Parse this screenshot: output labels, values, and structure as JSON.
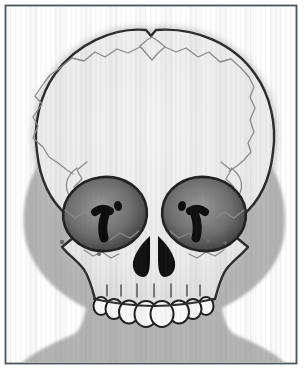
{
  "figure": {
    "view": "frontal"
  },
  "anatomy": {
    "teeth_count": 8,
    "orbit_count": 2,
    "parts": [
      "cranial-vault",
      "anterior-fontanelle",
      "coronal-suture-left",
      "coronal-suture-right",
      "temporal-crest-left",
      "temporal-crest-right",
      "orbit-left",
      "orbit-right",
      "superior-orbital-fissure-left",
      "superior-orbital-fissure-right",
      "optic-canal-left",
      "optic-canal-right",
      "nasal-aperture",
      "maxilla",
      "upper-teeth-row",
      "head-silhouette",
      "neck",
      "shoulders"
    ]
  },
  "colors": {
    "page_background": "#ffffff",
    "frame_border": "#4d5357",
    "silhouette_gray": "#b4b4b4",
    "halo_gray": "#bdbdbd",
    "dome_light": "#f4f4f4",
    "dome_mid": "#ebebeb",
    "dome_shade": "#d9d9d9",
    "skull_outline": "#2b2b2b",
    "suture_line": "#8c8c8c",
    "orbit_center": "#9a9a9a",
    "orbit_mid": "#6e6e6e",
    "orbit_edge": "#2e2e2e",
    "orbit_outline": "#1f1f1f",
    "fissure_black": "#0b0b0b",
    "nasal_black": "#0d0d0d",
    "tooth_fill": "#fbfbfb",
    "tooth_outline": "#1d1d1d",
    "root_line": "#4a4a4a",
    "foramen_dot": "#6a6a6a"
  }
}
